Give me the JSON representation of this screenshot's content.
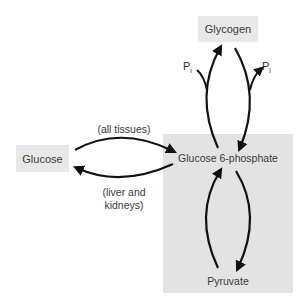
{
  "diagram": {
    "nodes": {
      "glycogen": "Glycogen",
      "glucose": "Glucose",
      "g6p": "Glucose 6-phosphate",
      "pyruvate": "Pyruvate"
    },
    "edge_labels": {
      "all_tissues": "(all tissues)",
      "liver_kidneys_line1": "(liver and",
      "liver_kidneys_line2": "kidneys)"
    },
    "phosphate": {
      "symbol": "P",
      "subscript": "i"
    },
    "edges": [
      {
        "from": "Glucose",
        "to": "Glucose 6-phosphate",
        "label": "(all tissues)"
      },
      {
        "from": "Glucose 6-phosphate",
        "to": "Glucose",
        "label": "(liver and kidneys)"
      },
      {
        "from": "Glucose 6-phosphate",
        "to": "Glycogen",
        "side_input": "Pi"
      },
      {
        "from": "Glycogen",
        "to": "Glucose 6-phosphate",
        "side_output": "Pi"
      },
      {
        "from": "Pyruvate",
        "to": "Glucose 6-phosphate"
      },
      {
        "from": "Glucose 6-phosphate",
        "to": "Pyruvate"
      }
    ],
    "colors": {
      "panel": "#e3e3e3",
      "box": "#e8e8e8",
      "arrow": "#111111",
      "text": "#3a3a3a"
    }
  }
}
